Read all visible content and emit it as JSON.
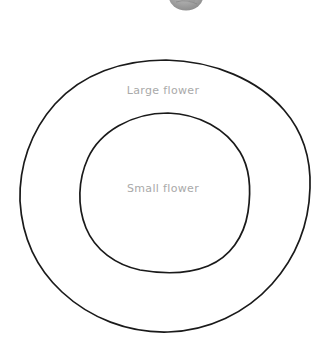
{
  "page": {
    "background_color": "#ffffff",
    "width": 326,
    "height": 345
  },
  "diagram": {
    "type": "nested-circles",
    "style": "hand-drawn",
    "stroke_color": "#1a1a1a",
    "stroke_width": 1.6,
    "label_color": "#a9a9a9",
    "outer_circle": {
      "name": "large-flower-circle",
      "label": "Large flower",
      "center_x": 165,
      "center_y": 196,
      "radius_x": 145,
      "radius_y": 136,
      "bounds": {
        "left": 20,
        "top": 60,
        "right": 310,
        "bottom": 332
      }
    },
    "inner_circle": {
      "name": "small-flower-circle",
      "label": "Small flower",
      "center_x": 165,
      "center_y": 193,
      "radius_x": 85,
      "radius_y": 80,
      "bounds": {
        "left": 80,
        "top": 113,
        "right": 250,
        "bottom": 273
      }
    }
  },
  "labels": {
    "large_flower": "Large flower",
    "small_flower": "Small flower"
  },
  "top_fragment": {
    "name": "cropped-round-object",
    "description": "partially cropped gray rounded object at top edge",
    "fill_color": "#9a9a9a",
    "left": 168,
    "width": 36,
    "visible_height": 12
  }
}
